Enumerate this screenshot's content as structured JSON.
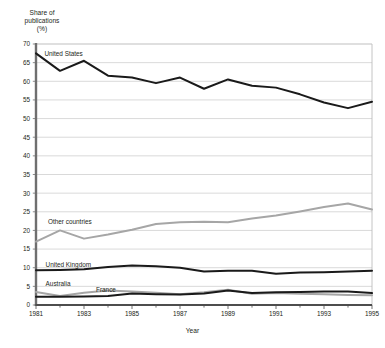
{
  "chart_data": {
    "type": "line",
    "title": "",
    "ylabel": "Share of\npublications\n(%)",
    "xlabel": "Year",
    "ylim": [
      0,
      70
    ],
    "ytick_step": 5,
    "yticks": [
      0,
      5,
      10,
      15,
      20,
      25,
      30,
      35,
      40,
      45,
      50,
      55,
      60,
      65,
      70
    ],
    "xlim": [
      1981,
      1995
    ],
    "xticks": [
      1981,
      1983,
      1985,
      1987,
      1989,
      1991,
      1993,
      1995
    ],
    "xtick_labels": [
      "1981",
      "1983",
      "1985",
      "1987",
      "1989",
      "1991",
      "1993",
      "1995"
    ],
    "x": [
      1981,
      1982,
      1983,
      1984,
      1985,
      1986,
      1987,
      1988,
      1989,
      1990,
      1991,
      1992,
      1993,
      1994,
      1995
    ],
    "grid": "horizontal",
    "legend_position": "inline-labels",
    "series": [
      {
        "name": "United States",
        "color": "#1a1a1a",
        "label_x": 1981.35,
        "label_y": 67.3,
        "values": [
          67.5,
          62.8,
          65.5,
          61.5,
          61.0,
          59.5,
          61.0,
          58.0,
          60.5,
          58.8,
          58.3,
          56.5,
          54.3,
          52.8,
          54.5
        ]
      },
      {
        "name": "Other countries",
        "color": "#a6a6a6",
        "label_x": 1981.5,
        "label_y": 22.2,
        "values": [
          17.0,
          20.0,
          17.8,
          18.9,
          20.2,
          21.7,
          22.2,
          22.3,
          22.2,
          23.2,
          24.0,
          25.1,
          26.3,
          27.2,
          25.6
        ]
      },
      {
        "name": "United Kingdom",
        "color": "#1a1a1a",
        "label_x": 1981.4,
        "label_y": 10.7,
        "values": [
          9.3,
          9.4,
          9.6,
          10.2,
          10.6,
          10.4,
          10.0,
          9.0,
          9.2,
          9.2,
          8.4,
          8.7,
          8.8,
          9.0,
          9.2
        ]
      },
      {
        "name": "Australia",
        "color": "#a6a6a6",
        "label_x": 1981.4,
        "label_y": 5.6,
        "values": [
          3.5,
          2.4,
          3.3,
          3.9,
          3.6,
          3.3,
          2.9,
          3.4,
          4.1,
          3.0,
          3.2,
          3.0,
          2.9,
          2.7,
          2.6
        ]
      },
      {
        "name": "France",
        "color": "#1a1a1a",
        "label_x": 1983.5,
        "label_y": 4.0,
        "values": [
          2.2,
          2.2,
          2.3,
          2.4,
          3.1,
          2.9,
          2.8,
          3.1,
          3.9,
          3.2,
          3.4,
          3.5,
          3.6,
          3.6,
          3.2
        ]
      }
    ]
  }
}
